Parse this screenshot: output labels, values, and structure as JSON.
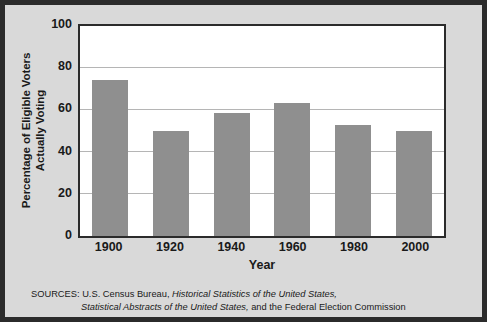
{
  "chart_data": {
    "type": "bar",
    "title": "",
    "xlabel": "Year",
    "ylabel": "Percentage of Eligible Voters Actually Voting",
    "ylabel_line1": "Percentage of Eligible Voters",
    "ylabel_line2": "Actually Voting",
    "categories": [
      "1900",
      "1920",
      "1940",
      "1960",
      "1980",
      "2000"
    ],
    "values": [
      74.5,
      50,
      58.5,
      63.5,
      53,
      50
    ],
    "ylim": [
      0,
      100
    ],
    "yticks": [
      "0",
      "20",
      "40",
      "60",
      "80",
      "100"
    ],
    "ytick_values": [
      0,
      20,
      40,
      60,
      80,
      100
    ],
    "grid": "horizontal",
    "legend": "none",
    "bar_color": "#8f8f8f",
    "plot_background": "#ffffff",
    "figure_background": "#d9d9d9",
    "border_color": "#2b2b2b",
    "gridline_color": "#b5b5b5"
  },
  "sources": {
    "label": "SOURCES:",
    "line1_plain_a": " U.S. Census Bureau, ",
    "line1_italic": "Historical Statistics of the United States,",
    "line2_italic": "Statistical Abstracts of the United States,",
    "line2_plain": " and the Federal Election Commission"
  }
}
